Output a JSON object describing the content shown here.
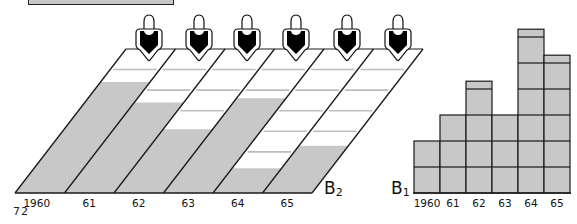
{
  "page_number": "72",
  "colors": {
    "fill": "#c8c8c8",
    "line": "#1a1a1a",
    "grid_white": "#ffffff",
    "figure_black": "#000000"
  },
  "diagram_b2": {
    "label": "B",
    "label_sub": "2",
    "years": [
      "1960",
      "61",
      "62",
      "63",
      "64",
      "65"
    ],
    "persons": 6,
    "grid_rows": 7,
    "filled_units": [
      5.4,
      4.4,
      3.1,
      4.6,
      1.2,
      2.3
    ]
  },
  "chart_data": {
    "type": "bar",
    "title": "B1",
    "categories": [
      "1960",
      "61",
      "62",
      "63",
      "64",
      "65"
    ],
    "values": [
      2,
      3,
      4.3,
      3,
      6.3,
      5.3
    ],
    "xlabel": "",
    "ylabel": "",
    "ylim": [
      0,
      6.5
    ],
    "grid": true,
    "label": "B",
    "label_sub": "1"
  }
}
